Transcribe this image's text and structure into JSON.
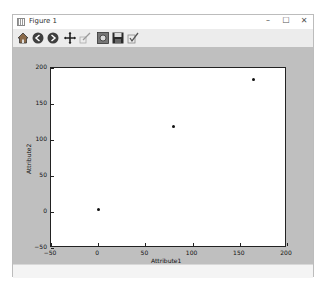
{
  "window": {
    "title": "Figure 1",
    "controls": {
      "minimize": "–",
      "maximize": "☐",
      "close": "✕"
    }
  },
  "toolbar": {
    "items": [
      {
        "name": "home",
        "icon": "home-icon"
      },
      {
        "name": "back",
        "icon": "back-arrow-icon"
      },
      {
        "name": "forward",
        "icon": "forward-arrow-icon"
      },
      {
        "name": "pan",
        "icon": "pan-icon"
      },
      {
        "name": "zoom",
        "icon": "zoom-rect-icon"
      },
      {
        "name": "subplots",
        "icon": "subplots-icon"
      },
      {
        "name": "save",
        "icon": "save-icon"
      },
      {
        "name": "edit",
        "icon": "edit-check-icon"
      }
    ]
  },
  "plot": {
    "xlabel": "Attribute1",
    "ylabel": "Attribute2",
    "xticks": [
      "-50",
      "0",
      "50",
      "100",
      "150",
      "200"
    ],
    "yticks": [
      "200",
      "150",
      "100",
      "50",
      "0",
      "-50"
    ]
  },
  "chart_data": {
    "type": "scatter",
    "title": "",
    "xlabel": "Attribute1",
    "ylabel": "Attribute2",
    "xlim": [
      -50,
      200
    ],
    "ylim": [
      -50,
      200
    ],
    "grid": false,
    "x": [
      1,
      80,
      165
    ],
    "y": [
      3,
      118,
      183
    ],
    "series": [
      {
        "name": "points",
        "x": [
          1,
          80,
          165
        ],
        "y": [
          3,
          118,
          183
        ],
        "color": "#111111"
      }
    ]
  },
  "colors": {
    "figure_bg": "#bfbfbf",
    "plot_bg": "#ffffff",
    "marker": "#111111"
  }
}
